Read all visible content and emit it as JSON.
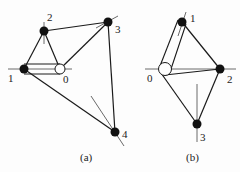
{
  "diagrams": [
    {
      "caption": "(a)",
      "nodes": [
        {
          "id": "0",
          "label": "0",
          "x": 60,
          "y": 69,
          "type": "hollow-circle"
        },
        {
          "id": "1",
          "label": "1",
          "x": 24,
          "y": 69,
          "type": "filled"
        },
        {
          "id": "2",
          "label": "2",
          "x": 44,
          "y": 31,
          "type": "filled"
        },
        {
          "id": "3",
          "label": "3",
          "x": 108,
          "y": 22,
          "type": "filled"
        },
        {
          "id": "4",
          "label": "4",
          "x": 115,
          "y": 132,
          "type": "filled"
        }
      ],
      "edges": [
        [
          "1",
          "2"
        ],
        [
          "2",
          "0"
        ],
        [
          "2",
          "3"
        ],
        [
          "0",
          "3"
        ],
        [
          "3",
          "4"
        ],
        [
          "1",
          "4"
        ],
        [
          "1",
          "0 (tube)"
        ]
      ]
    },
    {
      "caption": "(b)",
      "nodes": [
        {
          "id": "0",
          "label": "0",
          "x": 165,
          "y": 69,
          "type": "hollow-circle"
        },
        {
          "id": "1",
          "label": "1",
          "x": 182,
          "y": 22,
          "type": "filled"
        },
        {
          "id": "2",
          "label": "2",
          "x": 220,
          "y": 69,
          "type": "filled"
        },
        {
          "id": "3",
          "label": "3",
          "x": 197,
          "y": 124,
          "type": "filled"
        }
      ],
      "edges": [
        [
          "0",
          "1 (tube)"
        ],
        [
          "1",
          "2"
        ],
        [
          "0",
          "2"
        ],
        [
          "0",
          "3"
        ],
        [
          "2",
          "3"
        ]
      ]
    }
  ],
  "labels": {
    "a": {
      "n0": "0",
      "n1": "1",
      "n2": "2",
      "n3": "3",
      "n4": "4",
      "caption": "(a)"
    },
    "b": {
      "n0": "0",
      "n1": "1",
      "n2": "2",
      "n3": "3",
      "caption": "(b)"
    }
  },
  "colors": {
    "line": "#1a1a1a",
    "thin": "#444444",
    "node": "#111111",
    "background": "#fdfdfd"
  }
}
